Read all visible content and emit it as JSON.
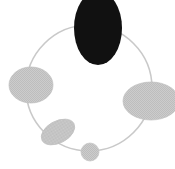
{
  "canvas": {
    "width": 175,
    "height": 169,
    "background": "#ffffff",
    "title": ""
  },
  "colors": {
    "ring_stroke": "#c9c9c9",
    "node_dark_fill": "#111111",
    "node_gray_fill": "#c8c8c8",
    "node_gray_fill_light": "#cfcfcf",
    "node_gray_stroke": "#b8b8b8",
    "dither_dark": "#b0b0b0"
  },
  "ring": {
    "label": "orbit-ring",
    "center_x": 89,
    "center_y": 88,
    "radius": 63,
    "stroke_width": 1.6
  },
  "nodes": [
    {
      "id": "node-top",
      "label": "",
      "shape": "ellipse",
      "cx": 98,
      "cy": 28,
      "rx": 24,
      "ry": 37,
      "rotation": 0,
      "fill": "#111111",
      "textured": false
    },
    {
      "id": "node-left",
      "label": "",
      "shape": "ellipse",
      "cx": 31,
      "cy": 85,
      "rx": 22,
      "ry": 18,
      "rotation": 0,
      "fill": "#c8c8c8",
      "textured": true
    },
    {
      "id": "node-right",
      "label": "",
      "shape": "ellipse",
      "cx": 151,
      "cy": 101,
      "rx": 28,
      "ry": 19,
      "rotation": 0,
      "fill": "#c8c8c8",
      "textured": true
    },
    {
      "id": "node-bottom-left",
      "label": "",
      "shape": "ellipse",
      "cx": 58,
      "cy": 132,
      "rx": 18,
      "ry": 11,
      "rotation": -28,
      "fill": "#c8c8c8",
      "textured": true
    },
    {
      "id": "node-bottom",
      "label": "",
      "shape": "ellipse",
      "cx": 90,
      "cy": 152,
      "rx": 9,
      "ry": 9,
      "rotation": 0,
      "fill": "#cfcfcf",
      "textured": true
    }
  ]
}
